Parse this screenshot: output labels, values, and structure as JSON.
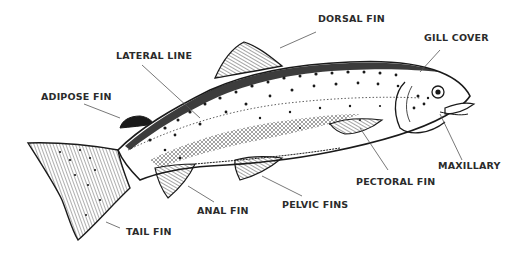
{
  "diagram": {
    "ink_color": "#1a1a1a",
    "leader_color": "#555555",
    "background": "#ffffff",
    "labels": {
      "dorsal_fin": "DORSAL FIN",
      "gill_cover": "GILL COVER",
      "lateral_line": "LATERAL LINE",
      "adipose_fin": "ADIPOSE FIN",
      "maxillary": "MAXILLARY",
      "pectoral_fin": "PECTORAL FIN",
      "pelvic_fins": "PELVIC FINS",
      "anal_fin": "ANAL FIN",
      "tail_fin": "TAIL FIN"
    }
  }
}
